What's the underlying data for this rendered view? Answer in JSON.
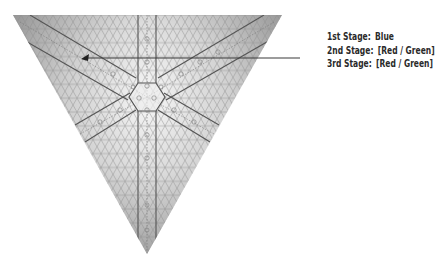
{
  "diagram": {
    "shape": "inverted-triangle",
    "vertices": {
      "top_left": [
        13,
        15
      ],
      "top_right": [
        282,
        15
      ],
      "bottom": [
        147,
        254
      ]
    },
    "center_hexagon": [
      147,
      97
    ],
    "colors": {
      "grid": "#9a9a9a",
      "strip": "#555555",
      "fill_dark": "#8c8c8c",
      "fill_light": "#f4f4f4",
      "arrow": "#222222"
    }
  },
  "annotation": {
    "arrow_tip": [
      81,
      58
    ],
    "leader_end": [
      300,
      58
    ],
    "stages": [
      {
        "name": "1st Stage:",
        "value": "Blue"
      },
      {
        "name": "2nd Stage:",
        "value": "[Red / Green]"
      },
      {
        "name": "3rd Stage:",
        "value": "[Red / Green]"
      }
    ]
  }
}
